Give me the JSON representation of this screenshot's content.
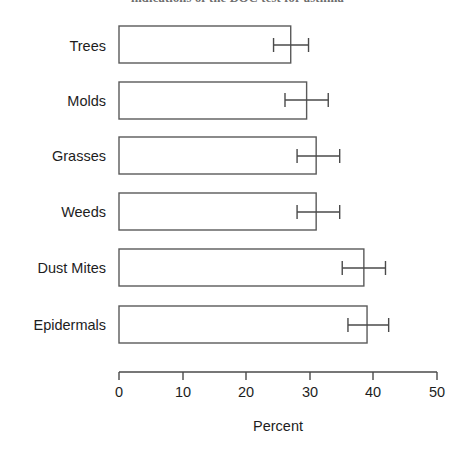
{
  "caption": {
    "text": "indications of the DOC test for asthma"
  },
  "chart_data": {
    "type": "bar",
    "orientation": "horizontal",
    "title": "",
    "subtitle": "",
    "xlabel": "Percent",
    "ylabel": "",
    "categories": [
      "Trees",
      "Molds",
      "Grasses",
      "Weeds",
      "Dust Mites",
      "Epidermals"
    ],
    "values": [
      27.0,
      29.5,
      31.0,
      31.0,
      38.5,
      39.0
    ],
    "errors_low": [
      2.7,
      3.4,
      3.0,
      3.0,
      3.4,
      3.0
    ],
    "errors_high": [
      2.8,
      3.4,
      3.7,
      3.7,
      3.4,
      3.4
    ],
    "error_bars": [
      {
        "category": "Trees",
        "value": 27.0,
        "lower": 24.3,
        "upper": 29.8
      },
      {
        "category": "Molds",
        "value": 29.5,
        "lower": 26.1,
        "upper": 32.9
      },
      {
        "category": "Grasses",
        "value": 31.0,
        "lower": 28.0,
        "upper": 34.7
      },
      {
        "category": "Weeds",
        "value": 31.0,
        "lower": 28.0,
        "upper": 34.7
      },
      {
        "category": "Dust Mites",
        "value": 38.5,
        "lower": 35.1,
        "upper": 41.9
      },
      {
        "category": "Epidermals",
        "value": 39.0,
        "lower": 36.0,
        "upper": 42.4
      }
    ],
    "xticks": [
      0,
      10,
      20,
      30,
      40,
      50
    ],
    "xtick_labels": [
      "0",
      "10",
      "20",
      "30",
      "40",
      "50"
    ],
    "xlim": [
      0,
      50
    ],
    "grid": false,
    "legend": false,
    "legend_position": "none",
    "colors": {
      "bar_fill": "#ffffff",
      "bar_stroke": "#5a5a5a",
      "error_bar": "#4a4a4a",
      "axis": "#4a4a4a",
      "text": "#1d1d1d",
      "background": "#ffffff"
    }
  }
}
